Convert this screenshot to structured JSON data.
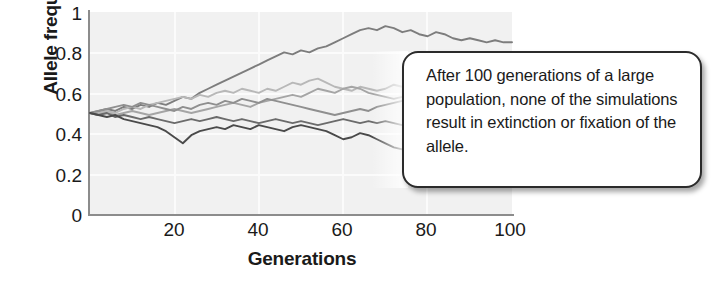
{
  "chart_data": {
    "type": "line",
    "title": "",
    "xlabel": "Generations",
    "ylabel": "Allele frequency",
    "xlim": [
      0,
      100
    ],
    "ylim": [
      0,
      1
    ],
    "xticks": [
      20,
      40,
      60,
      80,
      100
    ],
    "yticks": [
      "0",
      "0.2",
      "0.4",
      "0.6",
      "0.8",
      "1"
    ],
    "grid": true,
    "legend": "none",
    "annotations": [
      "After 100 generations of a large population, none of the simulations result in extinction or fixation of the allele."
    ],
    "x": [
      0,
      2,
      4,
      6,
      8,
      10,
      12,
      14,
      16,
      18,
      20,
      22,
      24,
      26,
      28,
      30,
      32,
      34,
      36,
      38,
      40,
      42,
      44,
      46,
      48,
      50,
      52,
      54,
      56,
      58,
      60,
      62,
      64,
      66,
      68,
      70,
      72,
      74,
      76,
      78,
      80,
      82,
      84,
      86,
      88,
      90,
      92,
      94,
      96,
      98,
      100
    ],
    "series": [
      {
        "name": "simulation-1",
        "color": "#7d7d7d",
        "values": [
          0.5,
          0.51,
          0.52,
          0.51,
          0.53,
          0.52,
          0.54,
          0.53,
          0.55,
          0.54,
          0.56,
          0.58,
          0.57,
          0.6,
          0.62,
          0.64,
          0.66,
          0.68,
          0.7,
          0.72,
          0.74,
          0.76,
          0.78,
          0.8,
          0.79,
          0.81,
          0.8,
          0.82,
          0.83,
          0.85,
          0.87,
          0.89,
          0.91,
          0.92,
          0.91,
          0.93,
          0.92,
          0.9,
          0.91,
          0.89,
          0.88,
          0.9,
          0.89,
          0.87,
          0.86,
          0.87,
          0.86,
          0.85,
          0.86,
          0.85,
          0.85
        ]
      },
      {
        "name": "simulation-2",
        "color": "#b8b8b8",
        "values": [
          0.5,
          0.5,
          0.51,
          0.5,
          0.52,
          0.53,
          0.52,
          0.54,
          0.55,
          0.56,
          0.57,
          0.58,
          0.57,
          0.59,
          0.58,
          0.6,
          0.61,
          0.6,
          0.62,
          0.61,
          0.6,
          0.62,
          0.61,
          0.63,
          0.65,
          0.64,
          0.66,
          0.67,
          0.65,
          0.63,
          0.62,
          0.61,
          0.63,
          0.62,
          0.61,
          0.62,
          0.64,
          0.63,
          0.65,
          0.66,
          0.64,
          0.65,
          0.66,
          0.65,
          0.64,
          0.65,
          0.64,
          0.63,
          0.64,
          0.65,
          0.64
        ]
      },
      {
        "name": "simulation-3",
        "color": "#a5a5a5",
        "values": [
          0.5,
          0.49,
          0.5,
          0.49,
          0.5,
          0.51,
          0.5,
          0.49,
          0.5,
          0.51,
          0.52,
          0.51,
          0.5,
          0.51,
          0.52,
          0.53,
          0.54,
          0.55,
          0.54,
          0.53,
          0.55,
          0.56,
          0.57,
          0.58,
          0.59,
          0.58,
          0.6,
          0.62,
          0.61,
          0.6,
          0.62,
          0.63,
          0.62,
          0.6,
          0.59,
          0.58,
          0.57,
          0.58,
          0.57,
          0.56,
          0.57,
          0.58,
          0.59,
          0.6,
          0.61,
          0.62,
          0.61,
          0.62,
          0.63,
          0.62,
          0.63
        ]
      },
      {
        "name": "simulation-4",
        "color": "#8f8f8f",
        "values": [
          0.5,
          0.51,
          0.52,
          0.53,
          0.54,
          0.53,
          0.55,
          0.54,
          0.53,
          0.52,
          0.51,
          0.53,
          0.52,
          0.54,
          0.55,
          0.54,
          0.56,
          0.55,
          0.57,
          0.56,
          0.55,
          0.57,
          0.56,
          0.55,
          0.54,
          0.53,
          0.52,
          0.51,
          0.5,
          0.49,
          0.5,
          0.51,
          0.52,
          0.51,
          0.53,
          0.54,
          0.55,
          0.56,
          0.57,
          0.58,
          0.57,
          0.56,
          0.55,
          0.56,
          0.57,
          0.56,
          0.57,
          0.58,
          0.57,
          0.56,
          0.57
        ]
      },
      {
        "name": "simulation-5",
        "color": "#6b6b6b",
        "values": [
          0.5,
          0.49,
          0.5,
          0.48,
          0.49,
          0.48,
          0.47,
          0.48,
          0.47,
          0.46,
          0.45,
          0.46,
          0.47,
          0.46,
          0.47,
          0.48,
          0.47,
          0.46,
          0.47,
          0.46,
          0.45,
          0.46,
          0.47,
          0.46,
          0.45,
          0.46,
          0.45,
          0.44,
          0.45,
          0.46,
          0.47,
          0.46,
          0.45,
          0.46,
          0.45,
          0.46,
          0.45,
          0.44,
          0.45,
          0.46,
          0.45,
          0.46,
          0.45,
          0.44,
          0.45,
          0.46,
          0.45,
          0.46,
          0.45,
          0.46,
          0.46
        ]
      },
      {
        "name": "simulation-6",
        "color": "#4a4a4a",
        "values": [
          0.5,
          0.49,
          0.48,
          0.49,
          0.47,
          0.46,
          0.45,
          0.44,
          0.43,
          0.41,
          0.38,
          0.35,
          0.39,
          0.41,
          0.42,
          0.43,
          0.42,
          0.44,
          0.43,
          0.42,
          0.44,
          0.43,
          0.42,
          0.41,
          0.43,
          0.44,
          0.43,
          0.42,
          0.41,
          0.39,
          0.37,
          0.38,
          0.4,
          0.39,
          0.37,
          0.35,
          0.33,
          0.32,
          0.3,
          0.29,
          0.28,
          0.27,
          0.26,
          0.25,
          0.24,
          0.23,
          0.22,
          0.21,
          0.21,
          0.2,
          0.2
        ]
      }
    ]
  },
  "callout": {
    "text": "After 100 generations of a large population, none of the simulations result in extinction or fixation of the allele."
  }
}
